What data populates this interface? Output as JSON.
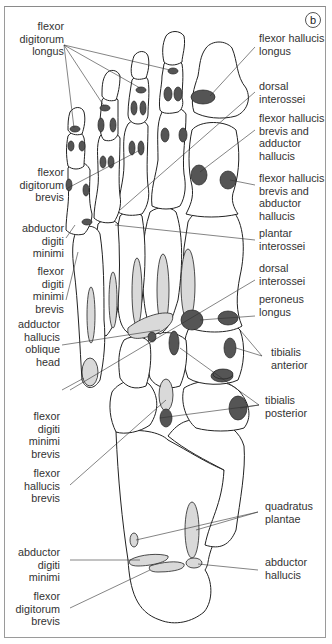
{
  "figure": {
    "panel_letter": "b",
    "colors": {
      "origin_fill_dark": "#555555",
      "insertion_fill_light": "#d9d9d9",
      "outline": "#222222",
      "frame": "#9a9a9a"
    }
  },
  "labels_left": [
    {
      "id": "fdl",
      "text": "flexor\ndigitorum\nlongus"
    },
    {
      "id": "fdb1",
      "text": "flexor\ndigitorum\nbrevis"
    },
    {
      "id": "adm1",
      "text": "abductor\ndigiti\nminimi"
    },
    {
      "id": "fdmb1",
      "text": "flexor\ndigiti\nminimi\nbrevis"
    },
    {
      "id": "ahoh",
      "text": "adductor\nhallucis\noblique\nhead"
    },
    {
      "id": "fdmb2",
      "text": "flexor\ndigiti\nminimi\nbrevis"
    },
    {
      "id": "fhb",
      "text": "flexor\nhallucis\nbrevis"
    },
    {
      "id": "adm2",
      "text": "abductor\ndigiti\nminimi"
    },
    {
      "id": "fdb2",
      "text": "flexor\ndigitorum\nbrevis"
    }
  ],
  "labels_right": [
    {
      "id": "fhl",
      "text": "flexor hallucis\nlongus"
    },
    {
      "id": "di1",
      "text": "dorsal\ninterossei"
    },
    {
      "id": "fhbah",
      "text": "flexor hallucis\nbrevis and\nadductor\nhallucis"
    },
    {
      "id": "fhbabh",
      "text": "flexor hallucis\nbrevis and\nabductor\nhallucis"
    },
    {
      "id": "pi",
      "text": "plantar\ninterossei"
    },
    {
      "id": "di2",
      "text": "dorsal\ninterossei"
    },
    {
      "id": "pl",
      "text": "peroneus\nlongus"
    },
    {
      "id": "ta",
      "text": "tibialis\nanterior"
    },
    {
      "id": "tp",
      "text": "tibialis\nposterior"
    },
    {
      "id": "qp",
      "text": "quadratus\nplantae"
    },
    {
      "id": "ah",
      "text": "abductor\nhallucis"
    }
  ]
}
